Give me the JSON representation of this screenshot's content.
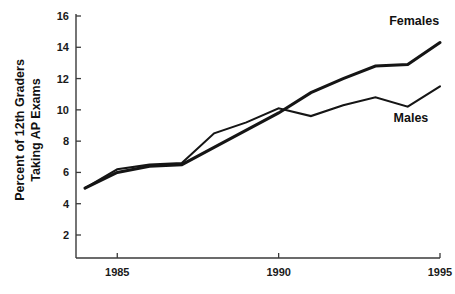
{
  "chart_data": {
    "type": "line",
    "title": "",
    "subtitle": "",
    "xlabel": "",
    "ylabel": "Percent of 12th Graders Taking AP Exams",
    "ylabel_line1": "Percent of 12th Graders",
    "ylabel_line2": "Taking AP Exams",
    "x": [
      1984,
      1985,
      1986,
      1987,
      1988,
      1989,
      1990,
      1991,
      1992,
      1993,
      1994,
      1995
    ],
    "xlim": [
      1984,
      1995
    ],
    "ylim": [
      0,
      16
    ],
    "grid": false,
    "legend_position": "inline-right",
    "xticks": [
      1985,
      1990,
      1995
    ],
    "xtick_labels": [
      "1985",
      "1990",
      "1995"
    ],
    "yticks": [
      2,
      4,
      6,
      8,
      10,
      12,
      14,
      16
    ],
    "ytick_labels": [
      "2",
      "4",
      "6",
      "8",
      "10",
      "12",
      "14",
      "16"
    ],
    "series": [
      {
        "name": "Females",
        "label": "Females",
        "color": "#151515",
        "stroke_width": 3.1,
        "values": [
          5.0,
          6.0,
          6.4,
          6.5,
          7.6,
          8.7,
          9.8,
          11.1,
          12.0,
          12.8,
          12.9,
          14.3
        ]
      },
      {
        "name": "Males",
        "label": "Males",
        "color": "#151515",
        "stroke_width": 2.1,
        "values": [
          5.0,
          6.2,
          6.5,
          6.6,
          8.5,
          9.2,
          10.1,
          9.6,
          10.3,
          10.8,
          10.2,
          11.5
        ]
      }
    ],
    "annotations": [
      {
        "text": "Females",
        "x": 1994.2,
        "y": 15.4
      },
      {
        "text": "Males",
        "x": 1994.1,
        "y": 9.2
      }
    ]
  },
  "colors": {
    "background": "#ffffff",
    "axis": "#3a3a3a",
    "line": "#151515",
    "text": "#111111"
  }
}
